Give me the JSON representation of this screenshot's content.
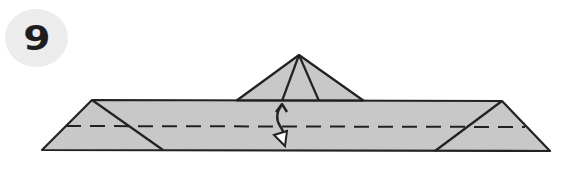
{
  "step": {
    "number": "9"
  },
  "diagram": {
    "type": "origami-fold-step",
    "fill_color": "#c8c8c8",
    "line_color": "#222222",
    "badge_color": "#ececec",
    "elements": [
      "valley-fold-line",
      "fold-over-and-back-arrow",
      "center-point-flap",
      "left-triangle-flap",
      "right-triangle-flap"
    ]
  }
}
